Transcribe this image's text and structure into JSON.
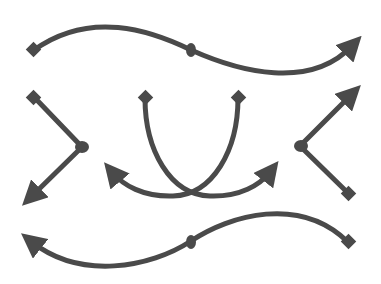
{
  "diagram": {
    "stroke_color": "#4a4a4a",
    "stroke_width": 5,
    "connectors": [
      {
        "id": "top-wave",
        "start": "diamond",
        "mid": "dot",
        "end": "arrow"
      },
      {
        "id": "left-chevron",
        "start": "diamond",
        "mid": "dot",
        "end": "arrow"
      },
      {
        "id": "center-curve-a",
        "start": "diamond",
        "end": "arrow"
      },
      {
        "id": "center-curve-b",
        "start": "diamond",
        "end": "arrow"
      },
      {
        "id": "right-chevron",
        "start": "diamond",
        "mid": "dot",
        "end": "arrow"
      },
      {
        "id": "bottom-wave",
        "start": "diamond",
        "mid": "dot",
        "end": "arrow"
      }
    ]
  }
}
